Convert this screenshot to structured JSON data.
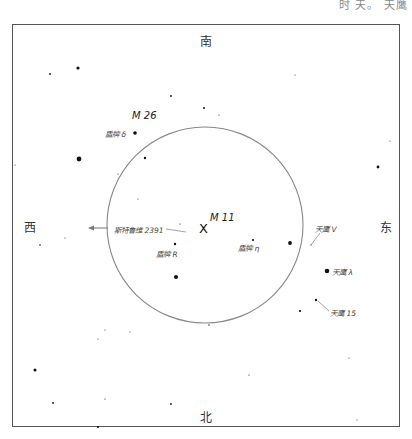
{
  "header": {
    "cut_text": "时 天。 天鹰"
  },
  "directions": {
    "south": "南",
    "north": "北",
    "west": "西",
    "east": "东"
  },
  "center": {
    "marker": "X",
    "label": "M 11"
  },
  "objects": {
    "m26": "M 26",
    "scutum_delta": "盾牌 δ",
    "stephenson": "斯特鲁维 2391",
    "scutum_r": "盾牌 R",
    "scutum_eta": "盾牌 η",
    "aquila_v": "天鹰 V",
    "aquila_lambda": "天鹰 λ",
    "aquila_15": "天鹰 15"
  },
  "colors": {
    "frame": "#555555",
    "circle": "#888888",
    "star": "#111111",
    "background": "#ffffff"
  },
  "field_circle": {
    "cx": 205,
    "cy": 225,
    "r": 98
  },
  "stars": [
    {
      "x": 78,
      "y": 68,
      "r": 1.6
    },
    {
      "x": 50,
      "y": 74,
      "r": 0.9
    },
    {
      "x": 171,
      "y": 96,
      "r": 0.9
    },
    {
      "x": 204,
      "y": 108,
      "r": 1.0
    },
    {
      "x": 219,
      "y": 115,
      "r": 0.6
    },
    {
      "x": 295,
      "y": 75,
      "r": 0.5
    },
    {
      "x": 135,
      "y": 133,
      "r": 1.8
    },
    {
      "x": 79,
      "y": 159,
      "r": 2.4
    },
    {
      "x": 145,
      "y": 158,
      "r": 1.2
    },
    {
      "x": 118,
      "y": 174,
      "r": 0.6
    },
    {
      "x": 378,
      "y": 167,
      "r": 1.4
    },
    {
      "x": 390,
      "y": 141,
      "r": 0.5
    },
    {
      "x": 138,
      "y": 199,
      "r": 0.5
    },
    {
      "x": 15,
      "y": 165,
      "r": 0.5
    },
    {
      "x": 40,
      "y": 245,
      "r": 0.8
    },
    {
      "x": 65,
      "y": 238,
      "r": 0.5
    },
    {
      "x": 180,
      "y": 224,
      "r": 0.6
    },
    {
      "x": 175,
      "y": 244,
      "r": 1.2
    },
    {
      "x": 253,
      "y": 240,
      "r": 1.1
    },
    {
      "x": 290,
      "y": 243,
      "r": 1.9
    },
    {
      "x": 311,
      "y": 245,
      "r": 0.6
    },
    {
      "x": 176,
      "y": 277,
      "r": 2.0
    },
    {
      "x": 327,
      "y": 271,
      "r": 2.3
    },
    {
      "x": 316,
      "y": 300,
      "r": 1.2
    },
    {
      "x": 300,
      "y": 311,
      "r": 1.1
    },
    {
      "x": 209,
      "y": 325,
      "r": 0.7
    },
    {
      "x": 105,
      "y": 330,
      "r": 0.5
    },
    {
      "x": 130,
      "y": 332,
      "r": 0.5
    },
    {
      "x": 98,
      "y": 339,
      "r": 0.5
    },
    {
      "x": 35,
      "y": 370,
      "r": 1.5
    },
    {
      "x": 249,
      "y": 375,
      "r": 0.6
    },
    {
      "x": 349,
      "y": 358,
      "r": 0.5
    },
    {
      "x": 53,
      "y": 403,
      "r": 0.9
    },
    {
      "x": 105,
      "y": 399,
      "r": 0.6
    },
    {
      "x": 171,
      "y": 404,
      "r": 0.9
    },
    {
      "x": 98,
      "y": 427,
      "r": 1.0
    },
    {
      "x": 357,
      "y": 420,
      "r": 0.5
    }
  ]
}
